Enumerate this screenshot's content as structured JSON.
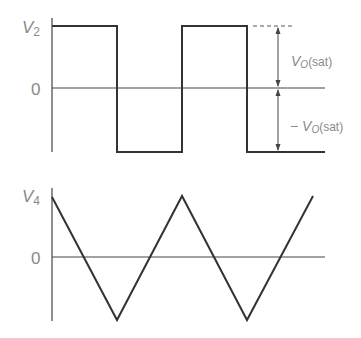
{
  "diagram": {
    "top_plot": {
      "y_label_main": "V",
      "y_label_sub": "2",
      "zero_label": "0",
      "waveform": "square",
      "annotation_upper_main": "V",
      "annotation_upper_sub": "O",
      "annotation_upper_suffix": "(sat)",
      "annotation_lower_prefix": "− ",
      "annotation_lower_main": "V",
      "annotation_lower_sub": "O",
      "annotation_lower_suffix": "(sat)"
    },
    "bottom_plot": {
      "y_label_main": "V",
      "y_label_sub": "4",
      "zero_label": "0",
      "waveform": "triangle"
    },
    "colors": {
      "line": "#333333",
      "label": "#8a8a8a"
    }
  }
}
